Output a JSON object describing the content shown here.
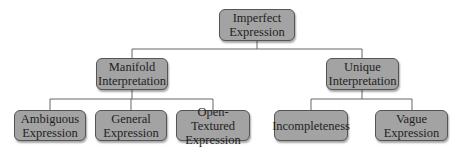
{
  "diagram": {
    "type": "tree",
    "root": {
      "label": "Imperfect Expression"
    },
    "level1": [
      {
        "label": "Manifold Interpretation"
      },
      {
        "label": "Unique Interpretation"
      }
    ],
    "level2": [
      {
        "label": "Ambiguous Expression",
        "parent": "Manifold Interpretation"
      },
      {
        "label": "General Expression",
        "parent": "Manifold Interpretation"
      },
      {
        "label": "Open-Textured Expression",
        "parent": "Manifold Interpretation"
      },
      {
        "label": "Incompleteness",
        "parent": "Unique Interpretation"
      },
      {
        "label": "Vague Expression",
        "parent": "Unique Interpretation"
      }
    ],
    "colors": {
      "node_fill": "#a3a3a3",
      "node_border": "#555555",
      "edge": "#666666"
    }
  }
}
